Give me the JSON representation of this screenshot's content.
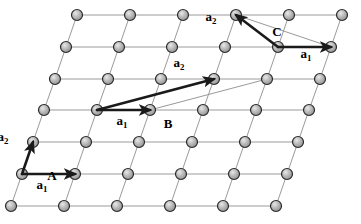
{
  "figure": {
    "type": "lattice-diagram",
    "width": 361,
    "height": 224,
    "background": "#ffffff"
  },
  "lattice": {
    "rows": 7,
    "columns": 6,
    "a_spacing_px": 53,
    "row_spacing_px": 32,
    "row_shear_px": -11,
    "origin": {
      "x": 77,
      "y": 15
    },
    "atom_radius_px": 5.5,
    "atom_fill": "#b0b0b0",
    "atom_stroke": "#2b2b2b",
    "bond_color": "#9a9a9a",
    "points": [
      {
        "row": 0,
        "y": 15,
        "xs": [
          77,
          130,
          183,
          236,
          289,
          342
        ]
      },
      {
        "row": 1,
        "y": 47,
        "xs": [
          66,
          119,
          172,
          225,
          278,
          331
        ]
      },
      {
        "row": 2,
        "y": 79,
        "xs": [
          55,
          108,
          161,
          214,
          267,
          320
        ]
      },
      {
        "row": 3,
        "y": 110,
        "xs": [
          44,
          97,
          150,
          203,
          256,
          309
        ]
      },
      {
        "row": 4,
        "y": 142,
        "xs": [
          33,
          86,
          139,
          192,
          245,
          298
        ]
      },
      {
        "row": 5,
        "y": 174,
        "xs": [
          22,
          75,
          128,
          181,
          234,
          287
        ]
      },
      {
        "row": 6,
        "y": 206,
        "xs": [
          11,
          64,
          117,
          170,
          223,
          276
        ]
      }
    ]
  },
  "cells": [
    {
      "id": "A",
      "label": "A",
      "label_pos": {
        "x": 52,
        "y": 175
      },
      "type": "primitive",
      "origin": {
        "x": 22,
        "y": 174
      },
      "a1": {
        "label": "a",
        "sub": "1",
        "from": {
          "x": 22,
          "y": 174
        },
        "to": {
          "x": 75,
          "y": 174
        },
        "label_pos": {
          "x": 42,
          "y": 186
        }
      },
      "a2": {
        "label": "a",
        "sub": "2",
        "from": {
          "x": 22,
          "y": 174
        },
        "to": {
          "x": 33,
          "y": 142
        },
        "label_pos": {
          "x": 3,
          "y": 138
        }
      }
    },
    {
      "id": "B",
      "label": "B",
      "label_pos": {
        "x": 168,
        "y": 123
      },
      "type": "non-primitive",
      "origin": {
        "x": 97,
        "y": 110
      },
      "a1": {
        "label": "a",
        "sub": "1",
        "from": {
          "x": 97,
          "y": 110
        },
        "to": {
          "x": 150,
          "y": 110
        },
        "label_pos": {
          "x": 122,
          "y": 122
        }
      },
      "a2": {
        "label": "a",
        "sub": "2",
        "from": {
          "x": 97,
          "y": 110
        },
        "to": {
          "x": 214,
          "y": 79
        },
        "label_pos": {
          "x": 179,
          "y": 64
        }
      },
      "closing_line": {
        "from": {
          "x": 150,
          "y": 110
        },
        "to": {
          "x": 267,
          "y": 79
        }
      }
    },
    {
      "id": "C",
      "label": "C",
      "label_pos": {
        "x": 277,
        "y": 31
      },
      "type": "primitive",
      "origin": {
        "x": 278,
        "y": 47
      },
      "a1": {
        "label": "a",
        "sub": "1",
        "from": {
          "x": 278,
          "y": 47
        },
        "to": {
          "x": 331,
          "y": 47
        },
        "label_pos": {
          "x": 306,
          "y": 55
        }
      },
      "a2": {
        "label": "a",
        "sub": "2",
        "from": {
          "x": 278,
          "y": 47
        },
        "to": {
          "x": 236,
          "y": 15
        },
        "label_pos": {
          "x": 211,
          "y": 18
        }
      },
      "closing_line": {
        "from": {
          "x": 236,
          "y": 15
        },
        "to": {
          "x": 331,
          "y": 47
        }
      }
    }
  ],
  "style": {
    "vector_color": "#1a1a1a",
    "vector_width_px": 2.6,
    "thin_line_color": "#8d8d8d",
    "thin_line_width_px": 0.9
  }
}
